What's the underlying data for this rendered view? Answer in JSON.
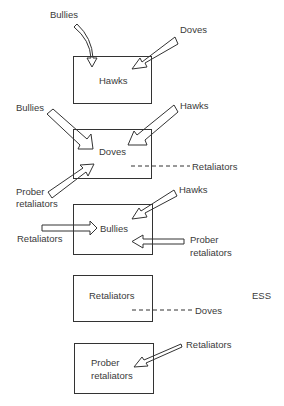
{
  "diagram": {
    "type": "strategy invasion diagram",
    "boxes": [
      {
        "label": "Hawks"
      },
      {
        "label": "Doves"
      },
      {
        "label": "Bullies"
      },
      {
        "label": "Retaliators"
      },
      {
        "label_line1": "Prober",
        "label_line2": "retaliators"
      }
    ],
    "invaders": {
      "box1": {
        "left": "Bullies",
        "right": "Doves"
      },
      "box2": {
        "left": "Bullies",
        "right": "Hawks",
        "bottom_left_line1": "Prober",
        "bottom_left_line2": "retaliators",
        "drift": "Retaliators"
      },
      "box3": {
        "top_right": "Hawks",
        "left": "Retaliators",
        "right_line1": "Prober",
        "right_line2": "retaliators"
      },
      "box4": {
        "drift": "Doves",
        "tag": "ESS"
      },
      "box5": {
        "right": "Retaliators"
      }
    },
    "legend": {
      "solid_arrow": "invades",
      "dashed_line": "drifts in"
    }
  }
}
